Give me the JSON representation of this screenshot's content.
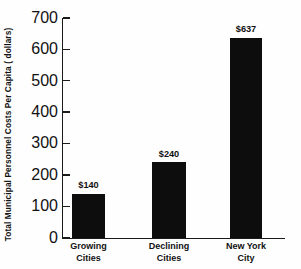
{
  "chart_data": {
    "type": "bar",
    "title": "",
    "subtitle": "",
    "xlabel": "",
    "ylabel": "Total Municipal Personnel Costs Per Capita ( dollars)",
    "categories": [
      "Growing\nCities",
      "Declining\nCities",
      "New York\nCity"
    ],
    "values": [
      140,
      240,
      637
    ],
    "value_labels": [
      "$140",
      "$240",
      "$637"
    ],
    "ylim": [
      0,
      700
    ],
    "ytick_values": [
      0,
      100,
      200,
      300,
      400,
      500,
      600,
      700
    ],
    "ytick_labels": [
      "0",
      "100",
      "200",
      "300",
      "400",
      "500",
      "600",
      "700"
    ],
    "grid": false,
    "legend": null,
    "bar_color": "#0d0d0d",
    "axis_color": "#1a1a1a",
    "background_color": "#fefefe"
  }
}
